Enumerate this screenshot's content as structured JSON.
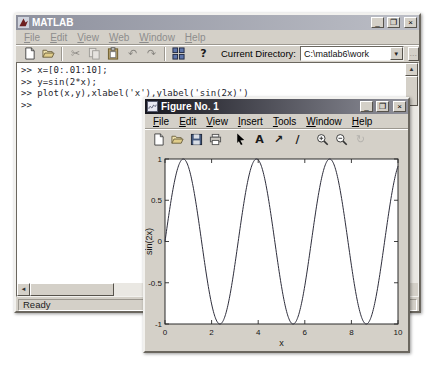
{
  "matlab_window": {
    "title": "MATLAB",
    "window_buttons": {
      "minimize": "_",
      "maximize": "❐",
      "close": "×"
    },
    "menu": [
      "File",
      "Edit",
      "View",
      "Web",
      "Window",
      "Help"
    ],
    "toolbar": {
      "buttons": [
        {
          "name": "new-file-button",
          "icon": "new-document-icon",
          "disabled": false
        },
        {
          "name": "open-file-button",
          "icon": "open-folder-icon",
          "disabled": false
        },
        {
          "separator": true
        },
        {
          "name": "cut-button",
          "icon": "cut-icon",
          "disabled": true
        },
        {
          "name": "copy-button",
          "icon": "copy-icon",
          "disabled": true
        },
        {
          "name": "paste-button",
          "icon": "paste-icon",
          "disabled": false
        },
        {
          "name": "undo-button",
          "icon": "undo-icon",
          "disabled": true
        },
        {
          "name": "redo-button",
          "icon": "redo-icon",
          "disabled": true
        },
        {
          "separator": true
        },
        {
          "name": "simulink-button",
          "icon": "simulink-icon",
          "disabled": false
        },
        {
          "gap": true
        },
        {
          "name": "help-button",
          "icon": "help-icon",
          "disabled": false
        }
      ],
      "current_directory_label": "Current Directory:",
      "current_directory_value": "C:\\matlab6\\work",
      "browse_label": "...",
      "dropdown_glyph": "▼"
    },
    "command_window": {
      "lines": [
        ">> x=[0:.01:10];",
        ">> y=sin(2*x);",
        ">> plot(x,y),xlabel('x'),ylabel('sin(2x)')",
        ">>"
      ],
      "scroll_up_glyph": "▲",
      "scroll_left_glyph": "◄"
    },
    "status_bar": {
      "text": "Ready"
    }
  },
  "figure_window": {
    "title": "Figure No. 1",
    "window_buttons": {
      "minimize": "_",
      "maximize": "❐",
      "close": "×"
    },
    "menu": [
      "File",
      "Edit",
      "View",
      "Insert",
      "Tools",
      "Window",
      "Help"
    ],
    "toolbar_buttons": [
      {
        "name": "new-figure-button",
        "icon": "new-document-icon",
        "disabled": false
      },
      {
        "name": "open-figure-button",
        "icon": "open-folder-icon",
        "disabled": false
      },
      {
        "name": "save-figure-button",
        "icon": "save-icon",
        "disabled": false
      },
      {
        "name": "print-figure-button",
        "icon": "print-icon",
        "disabled": false
      },
      {
        "gap": true
      },
      {
        "name": "edit-pointer-button",
        "icon": "pointer-icon",
        "disabled": false
      },
      {
        "name": "insert-text-button",
        "icon": "text-icon",
        "disabled": false
      },
      {
        "name": "insert-arrow-button",
        "icon": "arrow-annotation-icon",
        "disabled": false
      },
      {
        "name": "insert-line-button",
        "icon": "line-annotation-icon",
        "disabled": false
      },
      {
        "gap": true
      },
      {
        "name": "zoom-in-button",
        "icon": "zoom-in-icon",
        "disabled": false
      },
      {
        "name": "zoom-out-button",
        "icon": "zoom-out-icon",
        "disabled": false
      },
      {
        "name": "rotate-3d-button",
        "icon": "rotate-3d-icon",
        "disabled": true
      }
    ]
  },
  "chart_data": {
    "type": "line",
    "title": "",
    "xlabel": "x",
    "ylabel": "sin(2x)",
    "expression": "sin(2*x)",
    "amplitude": 1,
    "angular_frequency": 2,
    "x_range": [
      0,
      10
    ],
    "sample_step": 0.01,
    "xticks": [
      0,
      2,
      4,
      6,
      8,
      10
    ],
    "yticks": [
      1,
      0.5,
      0,
      -0.5,
      -1
    ],
    "ylim": [
      -1,
      1
    ],
    "grid": false,
    "legend": null,
    "line_color": "#2e2e3c",
    "axes_background": "#ffffff"
  }
}
